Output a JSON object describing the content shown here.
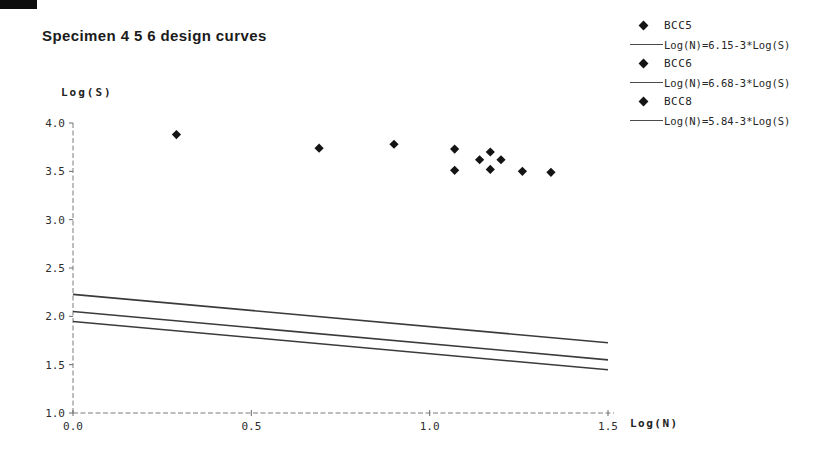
{
  "page": {
    "background": "#ffffff"
  },
  "colors": {
    "ink": "#1b1b1b",
    "axis": "#7d7d7d",
    "design_line": "#3b3b3b",
    "marker": "#141414"
  },
  "icons": {
    "scatter_marker": "filled-diamond",
    "legend_line_swatch": "horizontal-line"
  },
  "chart_data": {
    "type": "scatter",
    "title": "Specimen 4 5 6 design curves",
    "xlabel": "Log(N)",
    "ylabel": "Log(S)",
    "xlim": [
      0.0,
      1.5
    ],
    "ylim": [
      1.0,
      4.0
    ],
    "xticks": [
      0.0,
      0.5,
      1.0,
      1.5
    ],
    "yticks": [
      1.0,
      1.5,
      2.0,
      2.5,
      3.0,
      3.5,
      4.0
    ],
    "grid": false,
    "legend_position": "top-right",
    "marker_style": "filled-diamond",
    "points": [
      {
        "x": 0.29,
        "y": 3.88
      },
      {
        "x": 0.69,
        "y": 3.74
      },
      {
        "x": 0.9,
        "y": 3.78
      },
      {
        "x": 1.07,
        "y": 3.73
      },
      {
        "x": 1.07,
        "y": 3.51
      },
      {
        "x": 1.14,
        "y": 3.62
      },
      {
        "x": 1.17,
        "y": 3.7
      },
      {
        "x": 1.17,
        "y": 3.52
      },
      {
        "x": 1.2,
        "y": 3.62
      },
      {
        "x": 1.26,
        "y": 3.5
      },
      {
        "x": 1.34,
        "y": 3.49
      }
    ],
    "lines": [
      {
        "name": "BCC5",
        "equation": "Log(N)=6.15-3*Log(S)",
        "intercept": 6.15,
        "slope": -3,
        "y_start": 2.05,
        "y_end": 1.55
      },
      {
        "name": "BCC6",
        "equation": "Log(N)=6.68-3*Log(S)",
        "intercept": 6.68,
        "slope": -3,
        "y_start": 2.227,
        "y_end": 1.727
      },
      {
        "name": "BCC8",
        "equation": "Log(N)=5.84-3*Log(S)",
        "intercept": 5.84,
        "slope": -3,
        "y_start": 1.947,
        "y_end": 1.447
      }
    ],
    "legend": [
      {
        "type": "marker",
        "label": "BCC5"
      },
      {
        "type": "line",
        "label": "Log(N)=6.15-3*Log(S)"
      },
      {
        "type": "marker",
        "label": "BCC6"
      },
      {
        "type": "line",
        "label": "Log(N)=6.68-3*Log(S)"
      },
      {
        "type": "marker",
        "label": "BCC8"
      },
      {
        "type": "line",
        "label": "Log(N)=5.84-3*Log(S)"
      }
    ]
  }
}
